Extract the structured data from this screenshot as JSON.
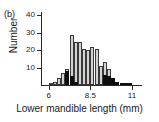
{
  "panel": {
    "label": "(b)"
  },
  "axes": {
    "ylabel": "Number",
    "xlabel": "Lower mandible length (mm)",
    "yticks": [
      "40",
      "30",
      "20",
      "10"
    ],
    "xticks": [
      "6",
      "8.5",
      "11"
    ]
  },
  "colors": {
    "light_bar": "#d2d2d2",
    "dark_bar": "#0d0d0d",
    "axis": "#2b2b2b",
    "text": "#1a1a1a",
    "background": "#ffffff"
  },
  "chart_data": {
    "type": "bar",
    "title": "",
    "subtitle": "",
    "xlabel": "Lower mandible length (mm)",
    "ylabel": "Number",
    "xlim": [
      5.6,
      11.6
    ],
    "ylim": [
      0,
      42
    ],
    "yticks": [
      10,
      20,
      30,
      40
    ],
    "xticks": [
      6,
      8.5,
      11
    ],
    "grid": false,
    "legend": null,
    "bin_width": 0.25,
    "bin_starts": [
      6.0,
      6.25,
      6.5,
      6.75,
      7.0,
      7.25,
      7.5,
      7.75,
      8.0,
      8.25,
      8.5,
      8.75,
      9.0,
      9.25,
      9.5,
      9.75,
      10.0,
      10.25,
      10.5,
      10.75,
      11.0
    ],
    "series": [
      {
        "name": "light",
        "color": "#d2d2d2",
        "values": [
          1,
          2,
          4,
          7,
          9,
          29,
          25,
          25,
          21,
          20,
          22,
          21,
          11,
          13,
          9,
          4,
          0,
          0,
          0,
          0,
          0
        ]
      },
      {
        "name": "dark",
        "color": "#0d0d0d",
        "values": [
          0,
          0,
          0,
          0,
          8,
          5,
          2,
          0,
          0,
          0,
          0,
          0,
          0,
          6,
          5,
          4,
          2,
          1,
          1,
          1,
          0
        ]
      }
    ]
  }
}
